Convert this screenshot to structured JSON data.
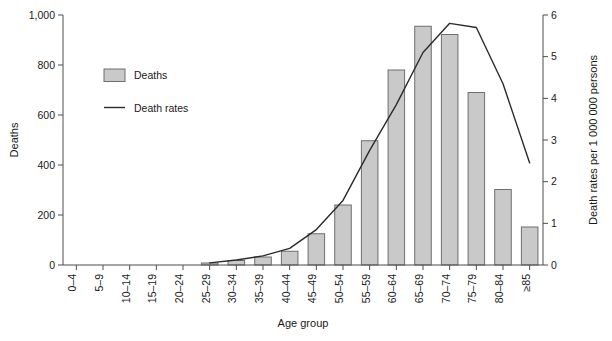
{
  "chart_data": {
    "type": "bar",
    "title": "",
    "subtitle": "",
    "xlabel": "Age group",
    "ylabel": "Deaths",
    "y2label": "Death rates per 1 000 000 persons",
    "grid": false,
    "legend_position": "upper-left-inside",
    "categories": [
      "0–4",
      "5–9",
      "10–14",
      "15–19",
      "20–24",
      "25–29",
      "30–34",
      "35–39",
      "40–44",
      "45–49",
      "50–54",
      "55–59",
      "60–64",
      "65–69",
      "70–74",
      "75–79",
      "80–84",
      "≥85"
    ],
    "ylim": [
      0,
      1000
    ],
    "yticks": [
      0,
      200,
      400,
      600,
      800,
      1000
    ],
    "ytick_labels": [
      "0",
      "200",
      "400",
      "600",
      "800",
      "1,000"
    ],
    "y2lim": [
      0,
      6
    ],
    "y2ticks": [
      0,
      1,
      2,
      3,
      4,
      5,
      6
    ],
    "y2tick_labels": [
      "0",
      "1",
      "2",
      "3",
      "4",
      "5",
      "6"
    ],
    "series": [
      {
        "name": "Deaths",
        "type": "bar",
        "axis": "left",
        "color": "#c9c9c9",
        "edge_color": "#6e6e6e",
        "values": [
          0,
          0,
          0,
          0,
          0,
          8,
          18,
          32,
          55,
          125,
          240,
          497,
          780,
          955,
          922,
          690,
          302,
          152
        ]
      },
      {
        "name": "Death rates",
        "type": "line",
        "axis": "right",
        "color": "#2b2b2b",
        "values": [
          null,
          null,
          null,
          null,
          null,
          0.05,
          0.12,
          0.22,
          0.4,
          0.85,
          1.55,
          2.75,
          3.85,
          5.1,
          5.8,
          5.7,
          4.35,
          2.45
        ]
      }
    ]
  },
  "legend": {
    "entries": [
      {
        "label": "Deaths",
        "marker": "swatch",
        "color": "#c9c9c9"
      },
      {
        "label": "Death rates",
        "marker": "line",
        "color": "#2b2b2b"
      }
    ]
  },
  "axes": {
    "left_title": "Deaths",
    "right_title": "Death rates per 1 000 000 persons",
    "bottom_title": "Age group"
  }
}
